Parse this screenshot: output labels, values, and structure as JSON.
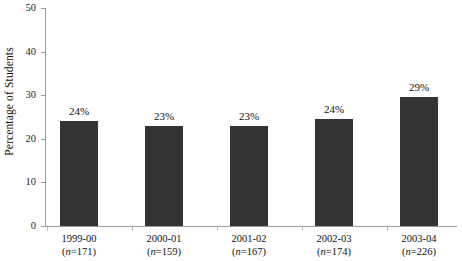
{
  "chart_data": {
    "type": "bar",
    "title": "",
    "subtitle": "",
    "xlabel": "",
    "ylabel": "Percentage of Students",
    "ylim": [
      0,
      50
    ],
    "ytick_labels": [
      "0",
      "10",
      "20",
      "30",
      "40",
      "50"
    ],
    "ytick_values": [
      0,
      10,
      20,
      30,
      40,
      50
    ],
    "grid": false,
    "legend": false,
    "legend_position": "none",
    "bar_color": "#333333",
    "axis_color": "#9a9a9a",
    "categories": [
      "1999-00",
      "2000-01",
      "2001-02",
      "2002-03",
      "2003-04"
    ],
    "values": [
      24,
      23,
      23,
      24.5,
      29.5
    ],
    "data_labels": [
      "24%",
      "23%",
      "23%",
      "24%",
      "29%"
    ],
    "sample_sizes": [
      "(n=171)",
      "(n=159)",
      "(n=167)",
      "(n=174)",
      "(n=226)"
    ],
    "sample_size_values": [
      171,
      159,
      167,
      174,
      226
    ],
    "bars": [
      {
        "category": "1999-00",
        "value": 24,
        "label": "24%",
        "n_prefix": "(",
        "n_italic": "n",
        "n_suffix": "=171)"
      },
      {
        "category": "2000-01",
        "value": 23,
        "label": "23%",
        "n_prefix": "(",
        "n_italic": "n",
        "n_suffix": "=159)"
      },
      {
        "category": "2001-02",
        "value": 23,
        "label": "23%",
        "n_prefix": "(",
        "n_italic": "n",
        "n_suffix": "=167)"
      },
      {
        "category": "2002-03",
        "value": 24.5,
        "label": "24%",
        "n_prefix": "(",
        "n_italic": "n",
        "n_suffix": "=174)"
      },
      {
        "category": "2003-04",
        "value": 29.5,
        "label": "29%",
        "n_prefix": "(",
        "n_italic": "n",
        "n_suffix": "=226)"
      }
    ]
  }
}
